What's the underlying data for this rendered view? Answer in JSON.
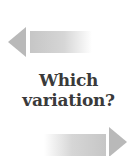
{
  "graphic": {
    "question_line1": "Which",
    "question_line2": "variation?",
    "left_arrow_icon": "arrow-left-icon",
    "right_arrow_icon": "arrow-right-icon",
    "colors": {
      "text": "#3a3a3a",
      "arrow_head": "#b9b9b9",
      "arrow_bar": "#c6c6c6",
      "background": "#ffffff"
    }
  }
}
